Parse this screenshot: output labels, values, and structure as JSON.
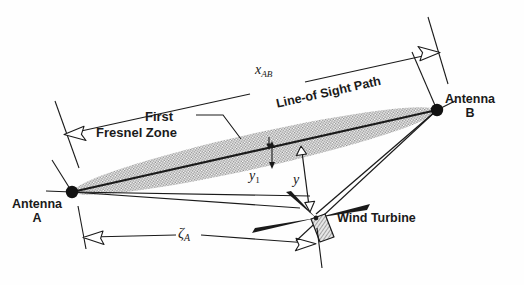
{
  "figure": {
    "type": "technical-line-diagram",
    "background_color": "#ffffff",
    "line_color": "#1a1a1a",
    "fresnel_fill_color": "#9a9a9a"
  },
  "labels": {
    "x_ab": "x",
    "x_ab_sub": "AB",
    "antenna_b_line1": "Antenna",
    "antenna_b_line2": "B",
    "antenna_a_line1": "Antenna",
    "antenna_a_line2": "A",
    "first": "First",
    "fresnel_zone": "Fresnel Zone",
    "line_of_sight_path": "Line-of Sight Path",
    "y1": "y",
    "y1_sub": "1",
    "y": "y",
    "zeta": "ζ",
    "zeta_sub": "A",
    "wind_turbine": "Wind Turbine"
  },
  "elements": {
    "antenna_a_marker": "filled-dot",
    "antenna_b_marker": "filled-dot",
    "fresnel_zone_shape": "shaded-ellipse",
    "dimension_x_ab": "double-ended-dimension-line",
    "dimension_zeta_a": "double-ended-dimension-line",
    "offset_y1": "double-headed-arrow",
    "offset_y": "double-headed-arrow",
    "turbine_symbol": "three-blade-rotor-with-nacelle"
  }
}
